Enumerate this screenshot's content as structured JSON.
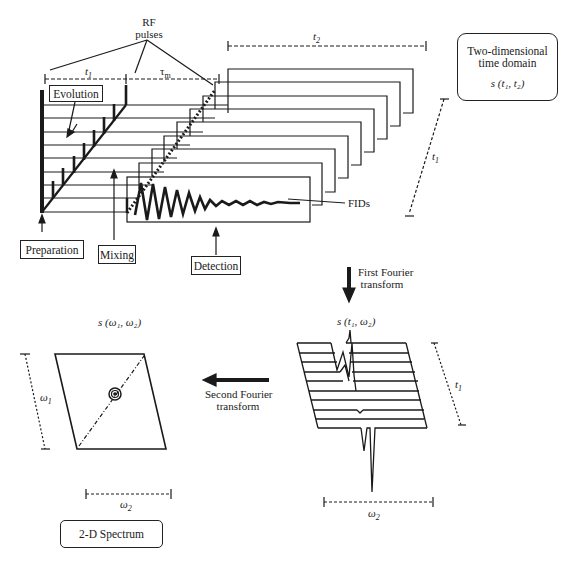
{
  "stages": {
    "preparation": "Preparation",
    "evolution": "Evolution",
    "mixing": "Mixing",
    "detection": "Detection"
  },
  "annotations": {
    "rf_pulses_line1": "RF",
    "rf_pulses_line2": "pulses",
    "fids": "FIDs",
    "t1": "t",
    "t1_sub": "1",
    "t2": "t",
    "t2_sub": "2",
    "tau_m": "τ",
    "tau_m_sub": "m",
    "w1": "ω",
    "w1_sub": "1",
    "w2": "ω",
    "w2_sub": "2"
  },
  "time_domain_box": {
    "line1": "Two-dimensional",
    "line2": "time domain",
    "formula": "s (t₁, t₂)"
  },
  "first_ft": {
    "line1": "First Fourier",
    "line2": "transform"
  },
  "second_ft": {
    "line1": "Second Fourier",
    "line2": "transform"
  },
  "intermediate_label": "s (t₁, ω₂)",
  "spectrum_label": "s (ω₁, ω₂)",
  "spectrum_box": "2-D Spectrum",
  "colors": {
    "ink": "#1a1a1a",
    "background": "#ffffff"
  }
}
